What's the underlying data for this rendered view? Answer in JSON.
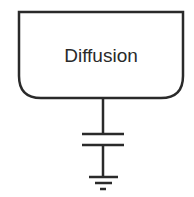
{
  "diagram": {
    "block": {
      "label": "Diffusion"
    },
    "components": [
      "capacitor-symbol",
      "ground-symbol"
    ],
    "colors": {
      "stroke": "#2a2a2a",
      "background": "#ffffff"
    }
  }
}
